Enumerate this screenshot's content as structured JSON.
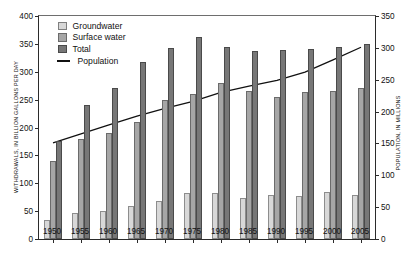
{
  "chart_data": {
    "type": "bar",
    "title": "",
    "xlabel": "",
    "ylabel": "WITHDRAWALS, IN BILLION GALLONS PER DAY",
    "ylabel_right": "POPULATION, IN MILLIONS",
    "categories": [
      "1950",
      "1955",
      "1960",
      "1965",
      "1970",
      "1975",
      "1980",
      "1985",
      "1990",
      "1995",
      "2000",
      "2005"
    ],
    "ylim": [
      0,
      400
    ],
    "yticks": [
      0,
      50,
      100,
      150,
      200,
      250,
      300,
      350,
      400
    ],
    "ylim_right": [
      0,
      350
    ],
    "yticks_right": [
      0,
      50,
      100,
      150,
      200,
      250,
      300,
      350
    ],
    "grid": false,
    "legend_position": "upper-left",
    "series": [
      {
        "name": "Groundwater",
        "type": "bar",
        "axis": "left",
        "color": "#d8d8d8",
        "values": [
          34,
          47,
          50,
          60,
          68,
          82,
          83,
          73,
          79,
          77,
          84,
          79
        ]
      },
      {
        "name": "Surface water",
        "type": "bar",
        "axis": "left",
        "color": "#a6a6a6",
        "values": [
          140,
          180,
          190,
          210,
          250,
          260,
          280,
          265,
          255,
          264,
          265,
          270
        ]
      },
      {
        "name": "Total",
        "type": "bar",
        "axis": "left",
        "color": "#777777",
        "values": [
          175,
          240,
          270,
          318,
          342,
          362,
          345,
          338,
          339,
          341,
          345,
          350
        ]
      },
      {
        "name": "Population",
        "type": "line",
        "axis": "right",
        "color": "#111111",
        "values": [
          151,
          165,
          179,
          193,
          205,
          216,
          230,
          240,
          249,
          262,
          281,
          301
        ]
      }
    ]
  },
  "legend": {
    "items": [
      {
        "label": "Groundwater",
        "swatch": "groundwater-swatch"
      },
      {
        "label": "Surface water",
        "swatch": "surface-water-swatch"
      },
      {
        "label": "Total",
        "swatch": "total-swatch"
      },
      {
        "label": "Population",
        "swatch": "population-line-swatch"
      }
    ]
  }
}
